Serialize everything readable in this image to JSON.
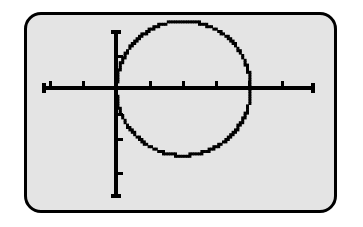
{
  "device": {
    "kind": "graphing-calculator-screen",
    "screen_background": "#e4e4e4",
    "bezel_color": "#000000",
    "page_background": "#ffffff",
    "plot_color": "#000000"
  },
  "chart_data": {
    "type": "scatter",
    "title": "",
    "subtitle": "",
    "xlabel": "",
    "ylabel": "",
    "grid": false,
    "legend": [],
    "legend_position": "none",
    "axis_style": "tick-marked-crosshair",
    "xlim": [
      -4.7,
      4.7
    ],
    "ylim": [
      -3.1,
      3.1
    ],
    "x_tick_interval": 1,
    "y_tick_interval": 1,
    "x_ticks": [
      -4,
      -3,
      -2,
      -1,
      0,
      1,
      2,
      3,
      4,
      5
    ],
    "y_ticks": [
      -3,
      -2,
      -1,
      0,
      1,
      2
    ],
    "curve_label": "circle tangent to y-axis at origin",
    "curve_equation": "(x - 2)^2 + y^2 = 2^2",
    "center": [
      2,
      0
    ],
    "radius": 2,
    "series": [
      {
        "name": "circle",
        "x": [
          0.0,
          0.02,
          0.08,
          0.18,
          0.31,
          0.49,
          0.69,
          0.93,
          1.2,
          1.49,
          1.79,
          2.1,
          2.41,
          2.71,
          2.99,
          3.24,
          3.47,
          3.66,
          3.81,
          3.92,
          3.98,
          4.0,
          3.98,
          3.92,
          3.81,
          3.66,
          3.47,
          3.24,
          2.99,
          2.71,
          2.41,
          2.1,
          1.79,
          1.49,
          1.2,
          0.93,
          0.69,
          0.49,
          0.31,
          0.18,
          0.08,
          0.02,
          0.0
        ],
        "y": [
          0.0,
          0.29,
          0.57,
          0.84,
          1.11,
          1.35,
          1.58,
          1.78,
          1.9,
          1.97,
          2.0,
          1.99,
          1.93,
          1.83,
          1.68,
          1.5,
          1.29,
          1.05,
          0.79,
          0.52,
          0.26,
          0.0,
          -0.26,
          -0.52,
          -0.79,
          -1.05,
          -1.29,
          -1.5,
          -1.68,
          -1.83,
          -1.93,
          -1.99,
          -2.0,
          -1.97,
          -1.9,
          -1.78,
          -1.58,
          -1.35,
          -1.11,
          -0.84,
          -0.57,
          -0.29,
          0.0
        ]
      }
    ],
    "annotations": []
  },
  "screen": {
    "plot_description": "A pixelated circle of radius 2 centered at (2, 0), tangent to the vertical y-axis at the origin, drawn on a tick-marked coordinate grid."
  }
}
